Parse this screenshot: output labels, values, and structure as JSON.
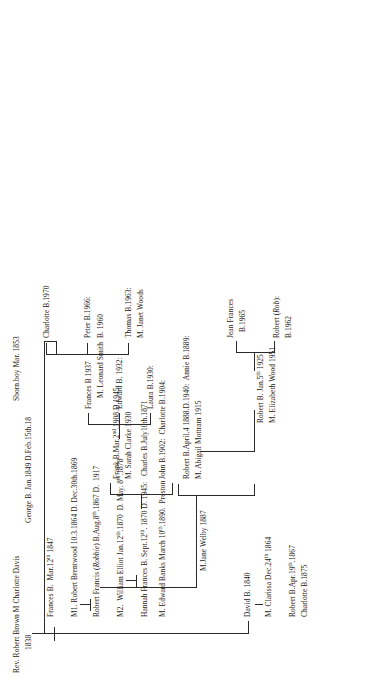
{
  "document": {
    "kind": "family-tree-chart",
    "orientation": "rotated-90-ccw",
    "ink_color": "#1a1a1a",
    "line_color": "#2b2b2b",
    "background": "#ffffff"
  },
  "root": {
    "name": "Rev. Robert Brown M Charlotte Davis",
    "marriage_year": "1838"
  },
  "generation1": {
    "child_david": "David B. 1840",
    "david_spouse": "M. Clarissa Dec.24",
    "david_spouse_sup": "th",
    "david_spouse_tail": " 1864",
    "child_frances": "Frances B.  Mar.12",
    "child_frances_sup": "th",
    "child_frances_tail": " 1847",
    "child_george": "George B. Jan.1849 D.Feb.15th.18",
    "child_stillborn": "Sborn.boy Mar. 1853"
  },
  "generation2": {
    "robert_b": "Robert B.Apr.19",
    "robert_b_sup": "th",
    "robert_b_tail": ".1867",
    "charlotte_b": "Charlotte B.1875",
    "marriage1_label": "M1. Robert Brentwood 10.3.1864 D. Dec.30th.1869",
    "robert_francis_pre": "Robert Francis (",
    "robert_francis_nick": "Robbie",
    "robert_francis_post": ") B.Aug.8",
    "robert_francis_sup": "th",
    "robert_francis_tail": ".1867 D.  1917",
    "marriage2_label_pre": "M2.  William Elliot Jan.12",
    "marriage2_sup": "th",
    "marriage2_tail": ".1870  D. May. 8",
    "marriage2_sup2": "th",
    "marriage2_tail2": ".1878",
    "hannah": "Hannah Frances B. Sept.12",
    "hannah_sup": "th",
    "hannah_tail": ". 1870 D. 1945:   Charles B.July10th.1871",
    "hannah_marriage": "M. Edward Banks March 10",
    "hannah_marriage_sup": "th",
    "hannah_marriage_tail": ".1890.  Preston"
  },
  "generation3": {
    "jane_welby": "M.Jane Welby 1887",
    "robert_annie_line1": "Robert B.April.4 1888.D.1940:  Annie B.1889:",
    "robert_annie_line2": "M. Abigail Mottram 1915",
    "john_charlotte": "John B.1902:  Charlotte B.1904:",
    "frank_line1_pre": "Frank B.Mar.2",
    "frank_line1_sup": "nd",
    "frank_line1_tail": ".1908.D.1945:",
    "frank_line2": "M. Sarah Clarke 1930"
  },
  "generation4": {
    "robert_jan_pre": "Robert B. Jan.5",
    "robert_jan_sup": "th",
    "robert_jan_tail": " 1925",
    "robert_jan_marriage": "M. Elizabeth Wood 1951",
    "laura": "Laura B.1930:",
    "edward": "Edward B. 1932:",
    "frances_line1": "Frances B 1937",
    "frances_line2": "M. Leonard Smith  B. 1960"
  },
  "generation5": {
    "robert_rob_line1_pre": "Robert (",
    "robert_rob_line1_nick": "Rob",
    "robert_rob_line1_post": "):",
    "robert_rob_line2": "B.1962",
    "jean_line1": "Jean Frances",
    "jean_line2": "B.1965",
    "thomas": "Thomas B.1963:",
    "peter": "Peter B.1966:",
    "charlotte": "Charlotte B,1970",
    "thomas_marriage": "M. Janet Woods"
  }
}
